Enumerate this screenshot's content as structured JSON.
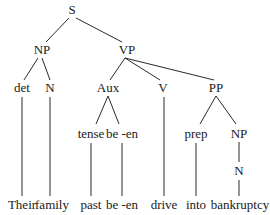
{
  "diagram": {
    "type": "syntax-tree",
    "nodes": {
      "s": {
        "label": "S",
        "x": 72,
        "y": 10
      },
      "np1": {
        "label": "NP",
        "x": 42,
        "y": 50
      },
      "vp": {
        "label": "VP",
        "x": 127,
        "y": 50
      },
      "det": {
        "label": "det",
        "x": 22,
        "y": 88
      },
      "n1": {
        "label": "N",
        "x": 50,
        "y": 88
      },
      "aux": {
        "label": "Aux",
        "x": 108,
        "y": 88
      },
      "v": {
        "label": "V",
        "x": 163,
        "y": 88
      },
      "pp": {
        "label": "PP",
        "x": 216,
        "y": 88
      },
      "tense": {
        "label": "tense",
        "x": 91,
        "y": 134
      },
      "be_en": {
        "label": "be -en",
        "x": 122,
        "y": 134
      },
      "prep": {
        "label": "prep",
        "x": 196,
        "y": 134
      },
      "np2": {
        "label": "NP",
        "x": 239,
        "y": 134
      },
      "n2": {
        "label": "N",
        "x": 239,
        "y": 171
      },
      "leaf_their": {
        "label": "Their",
        "x": 22,
        "y": 205
      },
      "leaf_family": {
        "label": "family",
        "x": 50,
        "y": 205
      },
      "leaf_past": {
        "label": "past",
        "x": 91,
        "y": 205
      },
      "leaf_be_en": {
        "label": "be -en",
        "x": 122,
        "y": 205
      },
      "leaf_drive": {
        "label": "drive",
        "x": 164,
        "y": 205
      },
      "leaf_into": {
        "label": "into",
        "x": 196,
        "y": 205
      },
      "leaf_bankruptcy": {
        "label": "bankruptcy",
        "x": 240,
        "y": 205
      }
    },
    "edges": [
      [
        "s",
        "np1"
      ],
      [
        "s",
        "vp"
      ],
      [
        "np1",
        "det"
      ],
      [
        "np1",
        "n1"
      ],
      [
        "vp",
        "aux"
      ],
      [
        "vp",
        "v"
      ],
      [
        "vp",
        "pp"
      ],
      [
        "aux",
        "tense"
      ],
      [
        "aux",
        "be_en"
      ],
      [
        "pp",
        "prep"
      ],
      [
        "pp",
        "np2"
      ],
      [
        "np2",
        "n2"
      ],
      [
        "det",
        "leaf_their"
      ],
      [
        "n1",
        "leaf_family"
      ],
      [
        "tense",
        "leaf_past"
      ],
      [
        "be_en",
        "leaf_be_en"
      ],
      [
        "v",
        "leaf_drive"
      ],
      [
        "prep",
        "leaf_into"
      ],
      [
        "n2",
        "leaf_bankruptcy"
      ]
    ],
    "sentence": "Their family past be -en drive into bankruptcy"
  }
}
